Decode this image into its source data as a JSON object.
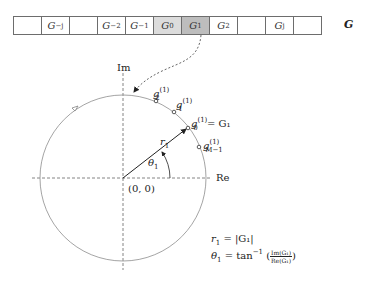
{
  "array": {
    "cells": [
      {
        "base": "",
        "sub": ""
      },
      {
        "base": "G",
        "sub": "−j"
      },
      {
        "base": "",
        "sub": ""
      },
      {
        "base": "G",
        "sub": "−2"
      },
      {
        "base": "G",
        "sub": "−1"
      },
      {
        "base": "G",
        "sub": "0"
      },
      {
        "base": "G",
        "sub": "1"
      },
      {
        "base": "G",
        "sub": "2"
      },
      {
        "base": "",
        "sub": ""
      },
      {
        "base": "G",
        "sub": "j"
      },
      {
        "base": "",
        "sub": ""
      }
    ],
    "label": "G",
    "highlight_colors": {
      "G0": "#dcdcdc",
      "G1": "#bdbdbd"
    }
  },
  "plane": {
    "imag_axis_label": "Im",
    "real_axis_label": "Re",
    "origin_label": "(0, 0)",
    "vector_label": "r",
    "vector_label_sub": "1",
    "angle_label": "θ",
    "angle_label_sub": "1",
    "points": [
      {
        "name": "g",
        "sub": "2",
        "sup": "(1)",
        "suffix": ""
      },
      {
        "name": "g",
        "sub": "1",
        "sup": "(1)",
        "suffix": ""
      },
      {
        "name": "g",
        "sub": "0",
        "sup": "(1)",
        "suffix": " = G₁"
      },
      {
        "name": "g",
        "sub": "M−1",
        "sup": "(1)",
        "suffix": ""
      }
    ]
  },
  "equations": {
    "r_eq_lhs": "r",
    "r_eq_sub": "1",
    "r_eq_rhs": " = |G₁|",
    "theta_eq_lhs": "θ",
    "theta_eq_sub": "1",
    "theta_eq_mid": " = tan",
    "theta_eq_sup": "−1",
    "theta_frac_num": "Im(G₁)",
    "theta_frac_den": "Re(G₁)"
  }
}
